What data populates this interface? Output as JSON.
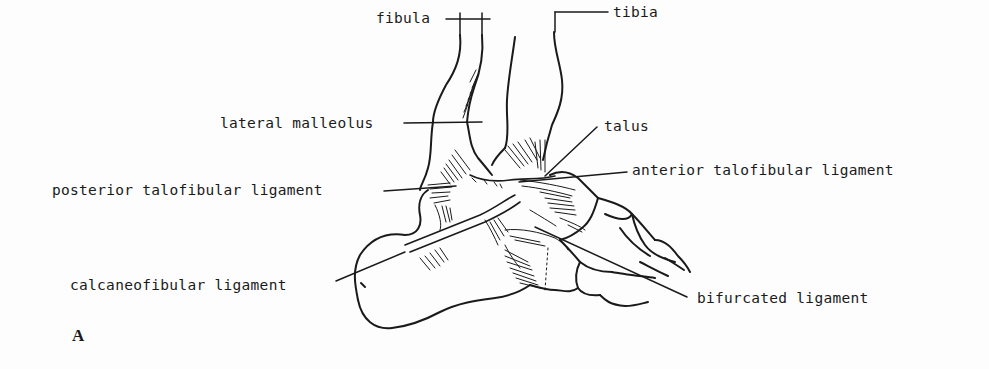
{
  "figure": {
    "panel_letter": "A",
    "labels": {
      "fibula": "fibula",
      "tibia": "tibia",
      "lateral_malleolus": "lateral malleolus",
      "talus": "talus",
      "posterior_talofibular_ligament": "posterior talofibular ligament",
      "anterior_talofibular_ligament": "anterior talofibular ligament",
      "calcaneofibular_ligament": "calcaneofibular ligament",
      "bifurcated_ligament": "bifurcated ligament"
    },
    "colors": {
      "ink": "#1a1a1a",
      "paper": "#fdfdfd"
    }
  }
}
